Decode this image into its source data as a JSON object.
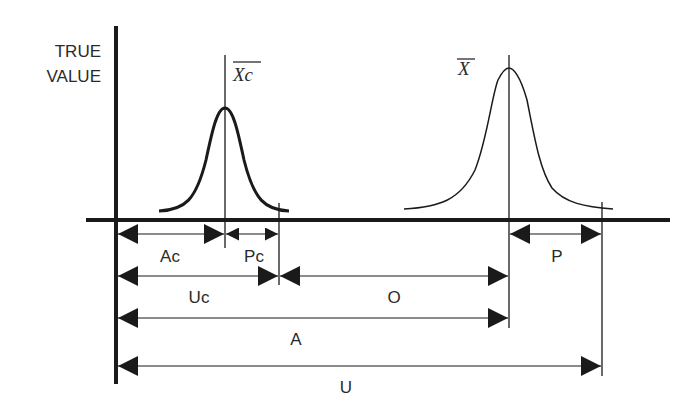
{
  "diagram": {
    "y_axis_label_line1": "TRUE",
    "y_axis_label_line2": "VALUE",
    "curves": [
      {
        "name": "calibration-distribution",
        "mean_label": "Xc",
        "style": "bold"
      },
      {
        "name": "measurement-distribution",
        "mean_label": "X",
        "style": "thin"
      }
    ],
    "dimensions": {
      "Ac": "Ac",
      "Pc": "Pc",
      "Uc": "Uc",
      "O": "O",
      "P": "P",
      "A": "A",
      "U": "U"
    },
    "colors": {
      "line": "#1a1a1a",
      "text": "#2a2a2a",
      "background": "#ffffff"
    }
  }
}
